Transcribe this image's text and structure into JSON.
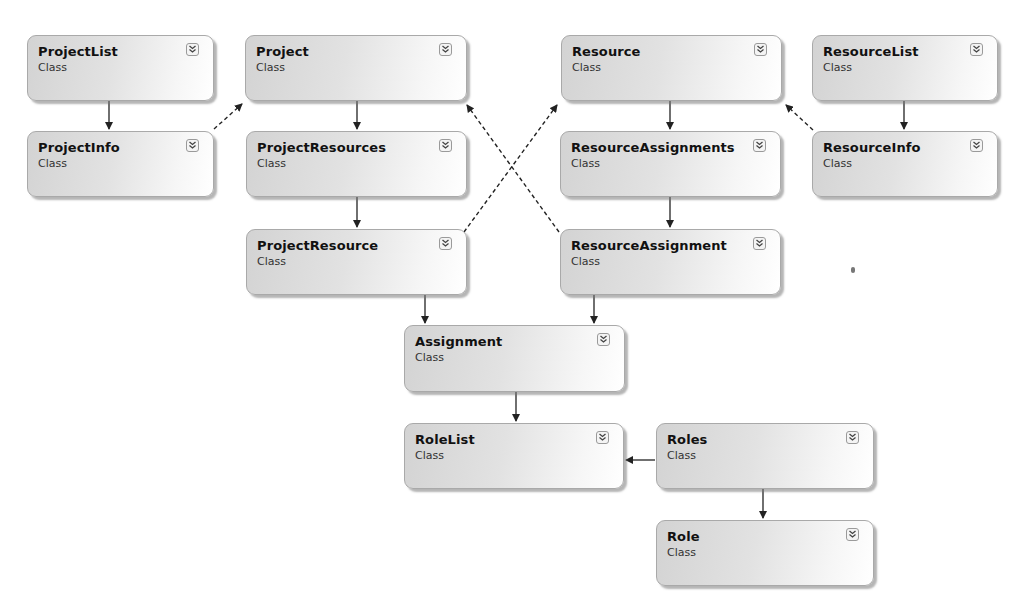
{
  "diagram": {
    "type": "class-diagram",
    "colors": {
      "box_border": "#a9a9a9",
      "box_fill_start": "#d3d3d3",
      "box_fill_end": "#ffffff",
      "line": "#222222"
    },
    "classes": [
      {
        "id": "projectlist",
        "name": "ProjectList",
        "kind": "Class",
        "icon": "expand-chevron-icon",
        "x": 27,
        "y": 35,
        "w": 187,
        "h": 66
      },
      {
        "id": "project",
        "name": "Project",
        "kind": "Class",
        "icon": "expand-chevron-icon",
        "x": 245,
        "y": 35,
        "w": 222,
        "h": 66
      },
      {
        "id": "resource",
        "name": "Resource",
        "kind": "Class",
        "icon": "expand-chevron-icon",
        "x": 561,
        "y": 35,
        "w": 221,
        "h": 66
      },
      {
        "id": "resourcelist",
        "name": "ResourceList",
        "kind": "Class",
        "icon": "expand-chevron-icon",
        "x": 812,
        "y": 35,
        "w": 186,
        "h": 66
      },
      {
        "id": "projectinfo",
        "name": "ProjectInfo",
        "kind": "Class",
        "icon": "expand-chevron-icon",
        "x": 27,
        "y": 131,
        "w": 187,
        "h": 66
      },
      {
        "id": "projectresources",
        "name": "ProjectResources",
        "kind": "Class",
        "icon": "expand-chevron-icon",
        "x": 246,
        "y": 131,
        "w": 221,
        "h": 66
      },
      {
        "id": "resourceassignments",
        "name": "ResourceAssignments",
        "kind": "Class",
        "icon": "expand-chevron-icon",
        "x": 560,
        "y": 131,
        "w": 221,
        "h": 66
      },
      {
        "id": "resourceinfo",
        "name": "ResourceInfo",
        "kind": "Class",
        "icon": "expand-chevron-icon",
        "x": 812,
        "y": 131,
        "w": 186,
        "h": 66
      },
      {
        "id": "projectresource",
        "name": "ProjectResource",
        "kind": "Class",
        "icon": "expand-chevron-icon",
        "x": 246,
        "y": 229,
        "w": 221,
        "h": 66
      },
      {
        "id": "resourceassignment",
        "name": "ResourceAssignment",
        "kind": "Class",
        "icon": "expand-chevron-icon",
        "x": 560,
        "y": 229,
        "w": 221,
        "h": 66
      },
      {
        "id": "assignment",
        "name": "Assignment",
        "kind": "Class",
        "icon": "expand-chevron-icon",
        "x": 404,
        "y": 325,
        "w": 221,
        "h": 67
      },
      {
        "id": "rolelist",
        "name": "RoleList",
        "kind": "Class",
        "icon": "expand-chevron-icon",
        "x": 404,
        "y": 423,
        "w": 220,
        "h": 66
      },
      {
        "id": "roles",
        "name": "Roles",
        "kind": "Class",
        "icon": "expand-chevron-icon",
        "x": 656,
        "y": 423,
        "w": 218,
        "h": 66
      },
      {
        "id": "role",
        "name": "Role",
        "kind": "Class",
        "icon": "expand-chevron-icon",
        "x": 656,
        "y": 520,
        "w": 218,
        "h": 66
      }
    ],
    "connectors": [
      {
        "from": "ProjectList",
        "to": "ProjectInfo",
        "style": "solid",
        "points": [
          [
            109,
            101
          ],
          [
            109,
            129
          ]
        ]
      },
      {
        "from": "Project",
        "to": "ProjectResources",
        "style": "solid",
        "points": [
          [
            357,
            101
          ],
          [
            357,
            129
          ]
        ]
      },
      {
        "from": "Resource",
        "to": "ResourceAssignments",
        "style": "solid",
        "points": [
          [
            670,
            101
          ],
          [
            670,
            129
          ]
        ]
      },
      {
        "from": "ResourceList",
        "to": "ResourceInfo",
        "style": "solid",
        "points": [
          [
            904,
            101
          ],
          [
            904,
            129
          ]
        ]
      },
      {
        "from": "ProjectResources",
        "to": "ProjectResource",
        "style": "solid",
        "points": [
          [
            357,
            197
          ],
          [
            357,
            227
          ]
        ]
      },
      {
        "from": "ResourceAssignments",
        "to": "ResourceAssignment",
        "style": "solid",
        "points": [
          [
            670,
            197
          ],
          [
            670,
            227
          ]
        ]
      },
      {
        "from": "ProjectResource",
        "to": "Assignment",
        "style": "solid",
        "points": [
          [
            425,
            295
          ],
          [
            425,
            323
          ]
        ]
      },
      {
        "from": "ResourceAssignment",
        "to": "Assignment",
        "style": "solid",
        "points": [
          [
            594,
            295
          ],
          [
            594,
            323
          ]
        ]
      },
      {
        "from": "Assignment",
        "to": "RoleList",
        "style": "solid",
        "points": [
          [
            516,
            392
          ],
          [
            516,
            421
          ]
        ]
      },
      {
        "from": "Roles",
        "to": "RoleList",
        "style": "solid",
        "points": [
          [
            655,
            460
          ],
          [
            626,
            460
          ]
        ]
      },
      {
        "from": "Roles",
        "to": "Role",
        "style": "solid",
        "points": [
          [
            763,
            489
          ],
          [
            763,
            518
          ]
        ]
      },
      {
        "from": "ProjectInfo",
        "to": "Project",
        "style": "dashed",
        "points": [
          [
            214,
            129
          ],
          [
            242,
            104
          ]
        ]
      },
      {
        "from": "ProjectResource",
        "to": "Resource",
        "style": "dashed",
        "points": [
          [
            464,
            232
          ],
          [
            557,
            105
          ]
        ]
      },
      {
        "from": "ResourceAssignment",
        "to": "Project",
        "style": "dashed",
        "points": [
          [
            559,
            232
          ],
          [
            467,
            105
          ]
        ]
      },
      {
        "from": "ResourceInfo",
        "to": "Resource",
        "style": "dashed",
        "points": [
          [
            813,
            130
          ],
          [
            786,
            105
          ]
        ]
      }
    ]
  }
}
